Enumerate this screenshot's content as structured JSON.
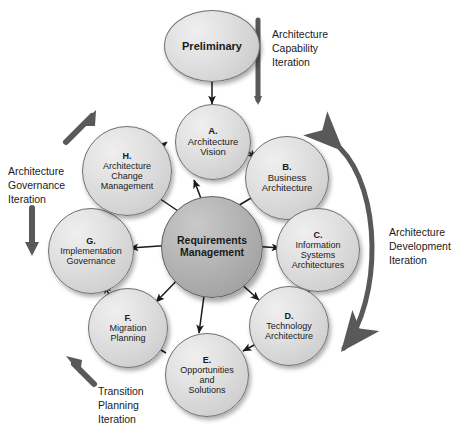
{
  "diagram": {
    "palette": {
      "node_fill": "#d8d8d8",
      "hub_fill": "#a8a8a8",
      "node_stroke": "#6f6f6f",
      "arrow": "#1a1a1a",
      "iteration_arrow": "#595959",
      "background": "#ffffff"
    },
    "hub": {
      "id": "requirements-management",
      "label": "Requirements\nManagement",
      "line1": "Requirements",
      "line2": "Management"
    },
    "nodes": [
      {
        "id": "preliminary",
        "letter": "",
        "name": "Preliminary",
        "lines": [
          "Preliminary"
        ]
      },
      {
        "id": "phase-a",
        "letter": "A.",
        "name": "Architecture Vision",
        "lines": [
          "Architecture",
          "Vision"
        ]
      },
      {
        "id": "phase-b",
        "letter": "B.",
        "name": "Business Architecture",
        "lines": [
          "Business",
          "Architecture"
        ]
      },
      {
        "id": "phase-c",
        "letter": "C.",
        "name": "Information Systems Architectures",
        "lines": [
          "Information",
          "Systems",
          "Architectures"
        ]
      },
      {
        "id": "phase-d",
        "letter": "D.",
        "name": "Technology Architecture",
        "lines": [
          "Technology",
          "Architecture"
        ]
      },
      {
        "id": "phase-e",
        "letter": "E.",
        "name": "Opportunities and Solutions",
        "lines": [
          "Opportunities",
          "and",
          "Solutions"
        ]
      },
      {
        "id": "phase-f",
        "letter": "F.",
        "name": "Migration Planning",
        "lines": [
          "Migration",
          "Planning"
        ]
      },
      {
        "id": "phase-g",
        "letter": "G.",
        "name": "Implementation Governance",
        "lines": [
          "Implementation",
          "Governance"
        ]
      },
      {
        "id": "phase-h",
        "letter": "H.",
        "name": "Architecture Change Management",
        "lines": [
          "Architecture",
          "Change",
          "Management"
        ]
      }
    ],
    "iterations": [
      {
        "id": "architecture-capability-iteration",
        "label": "Architecture\nCapability\nIteration",
        "position": "top-right"
      },
      {
        "id": "architecture-development-iteration",
        "label": "Architecture\nDevelopment\nIteration",
        "position": "right"
      },
      {
        "id": "transition-planning-iteration",
        "label": "Transition\nPlanning\nIteration",
        "position": "bottom-left"
      },
      {
        "id": "architecture-governance-iteration",
        "label": "Architecture\nGovernance\nIteration",
        "position": "left"
      }
    ]
  }
}
